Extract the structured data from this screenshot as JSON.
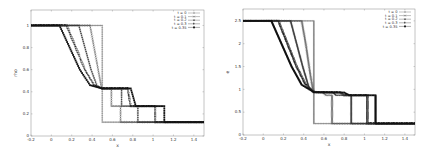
{
  "chart_data": [
    {
      "type": "line",
      "title": "",
      "xlabel": "x",
      "ylabel": "rho",
      "xlim": [
        -0.2,
        1.5
      ],
      "ylim": [
        0,
        1.14
      ],
      "xticks": [
        -0.2,
        0,
        0.2,
        0.4,
        0.6,
        0.8,
        1,
        1.2,
        1.4
      ],
      "xtick_labels": [
        "-0.2",
        "0",
        "0.2",
        "0.4",
        "0.6",
        "0.8",
        "1",
        "1.2",
        "1.4"
      ],
      "yticks": [
        0,
        0.2,
        0.4,
        0.6,
        0.8,
        1
      ],
      "ytick_labels": [
        "0",
        "0.2",
        "0.4",
        "0.6",
        "0.8",
        "1"
      ],
      "grid": false,
      "legend_position": "upper right",
      "frame": {
        "left": 31,
        "right": 204,
        "top": 10,
        "bottom": 136
      },
      "series": [
        {
          "name": "t = 0",
          "marker": "plus",
          "points": [
            [
              -0.2,
              1
            ],
            [
              0.5,
              1
            ],
            [
              0.5,
              0.125
            ],
            [
              1.5,
              0.125
            ]
          ]
        },
        {
          "name": "t = 0.1",
          "marker": "cross",
          "points": [
            [
              -0.2,
              1
            ],
            [
              0.38,
              1
            ],
            [
              0.42,
              0.8
            ],
            [
              0.46,
              0.6
            ],
            [
              0.49,
              0.45
            ],
            [
              0.5,
              0.43
            ],
            [
              0.59,
              0.43
            ],
            [
              0.59,
              0.27
            ],
            [
              0.68,
              0.27
            ],
            [
              0.68,
              0.125
            ],
            [
              1.5,
              0.125
            ]
          ]
        },
        {
          "name": "t = 0.2",
          "marker": "star",
          "points": [
            [
              -0.2,
              1
            ],
            [
              0.27,
              1
            ],
            [
              0.33,
              0.8
            ],
            [
              0.39,
              0.6
            ],
            [
              0.45,
              0.45
            ],
            [
              0.5,
              0.43
            ],
            [
              0.69,
              0.43
            ],
            [
              0.69,
              0.27
            ],
            [
              0.85,
              0.27
            ],
            [
              0.85,
              0.125
            ],
            [
              1.5,
              0.125
            ]
          ]
        },
        {
          "name": "t = 0.3",
          "marker": "square",
          "points": [
            [
              -0.2,
              1
            ],
            [
              0.15,
              1
            ],
            [
              0.24,
              0.8
            ],
            [
              0.33,
              0.6
            ],
            [
              0.42,
              0.46
            ],
            [
              0.5,
              0.43
            ],
            [
              0.75,
              0.43
            ],
            [
              0.78,
              0.27
            ],
            [
              1.02,
              0.27
            ],
            [
              1.02,
              0.125
            ],
            [
              1.5,
              0.125
            ]
          ]
        },
        {
          "name": "t = 0.35",
          "marker": "filled-square",
          "points": [
            [
              -0.2,
              1
            ],
            [
              0.08,
              1
            ],
            [
              0.18,
              0.8
            ],
            [
              0.28,
              0.6
            ],
            [
              0.38,
              0.46
            ],
            [
              0.5,
              0.43
            ],
            [
              0.78,
              0.43
            ],
            [
              0.83,
              0.27
            ],
            [
              1.11,
              0.27
            ],
            [
              1.11,
              0.125
            ],
            [
              1.5,
              0.125
            ]
          ]
        }
      ]
    },
    {
      "type": "line",
      "title": "",
      "xlabel": "x",
      "ylabel": "e",
      "xlim": [
        -0.2,
        1.5
      ],
      "ylim": [
        0,
        2.76
      ],
      "xticks": [
        -0.2,
        0,
        0.2,
        0.4,
        0.6,
        0.8,
        1,
        1.2,
        1.4
      ],
      "xtick_labels": [
        "-0.2",
        "0",
        "0.2",
        "0.4",
        "0.6",
        "0.8",
        "1",
        "1.2",
        "1.4"
      ],
      "yticks": [
        0,
        0.5,
        1,
        1.5,
        2,
        2.5
      ],
      "ytick_labels": [
        "0",
        "0.5",
        "1",
        "1.5",
        "2",
        "2.5"
      ],
      "grid": false,
      "legend_position": "upper right",
      "frame": {
        "left": 243,
        "right": 415,
        "top": 9,
        "bottom": 135
      },
      "series": [
        {
          "name": "t = 0",
          "marker": "plus",
          "points": [
            [
              -0.2,
              2.5
            ],
            [
              0.5,
              2.5
            ],
            [
              0.5,
              0.25
            ],
            [
              1.5,
              0.25
            ]
          ]
        },
        {
          "name": "t = 0.1",
          "marker": "cross",
          "points": [
            [
              -0.2,
              2.5
            ],
            [
              0.38,
              2.5
            ],
            [
              0.42,
              2.0
            ],
            [
              0.46,
              1.4
            ],
            [
              0.49,
              1.0
            ],
            [
              0.52,
              0.93
            ],
            [
              0.59,
              0.93
            ],
            [
              0.62,
              0.87
            ],
            [
              0.68,
              0.87
            ],
            [
              0.68,
              0.25
            ],
            [
              1.5,
              0.25
            ]
          ]
        },
        {
          "name": "t = 0.2",
          "marker": "star",
          "points": [
            [
              -0.2,
              2.5
            ],
            [
              0.27,
              2.5
            ],
            [
              0.33,
              2.0
            ],
            [
              0.39,
              1.5
            ],
            [
              0.45,
              1.05
            ],
            [
              0.5,
              0.93
            ],
            [
              0.69,
              0.93
            ],
            [
              0.72,
              0.87
            ],
            [
              0.87,
              0.87
            ],
            [
              0.87,
              0.25
            ],
            [
              1.5,
              0.25
            ]
          ]
        },
        {
          "name": "t = 0.3",
          "marker": "square",
          "points": [
            [
              -0.2,
              2.5
            ],
            [
              0.15,
              2.5
            ],
            [
              0.24,
              2.0
            ],
            [
              0.33,
              1.5
            ],
            [
              0.42,
              1.1
            ],
            [
              0.5,
              0.94
            ],
            [
              0.76,
              0.93
            ],
            [
              0.8,
              0.87
            ],
            [
              1.03,
              0.87
            ],
            [
              1.03,
              0.25
            ],
            [
              1.5,
              0.25
            ]
          ]
        },
        {
          "name": "t = 0.35",
          "marker": "filled-square",
          "points": [
            [
              -0.2,
              2.5
            ],
            [
              0.08,
              2.5
            ],
            [
              0.18,
              2.0
            ],
            [
              0.28,
              1.5
            ],
            [
              0.38,
              1.1
            ],
            [
              0.5,
              0.94
            ],
            [
              0.8,
              0.93
            ],
            [
              0.85,
              0.87
            ],
            [
              1.11,
              0.87
            ],
            [
              1.11,
              0.25
            ],
            [
              1.5,
              0.25
            ]
          ]
        }
      ]
    }
  ],
  "legend": {
    "entries": [
      "t = 0",
      "t = 0.1",
      "t = 0.2",
      "t = 0.3",
      "t = 0.35"
    ]
  }
}
